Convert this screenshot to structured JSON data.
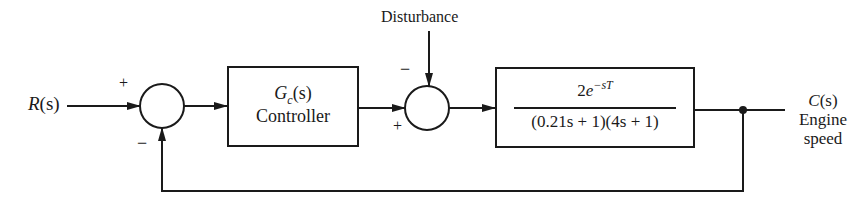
{
  "diagram": {
    "type": "feedback-control-block-diagram",
    "input": {
      "label_var": "R",
      "label_arg": "(s)"
    },
    "summing_junction_1": {
      "plus_sign": "+",
      "minus_sign": "−"
    },
    "controller": {
      "tf_main": "G",
      "tf_sub": "c",
      "tf_arg": "(s)",
      "name": "Controller"
    },
    "disturbance": {
      "label": "Disturbance"
    },
    "summing_junction_2": {
      "minus_sign": "−",
      "plus_sign": "+"
    },
    "plant": {
      "numerator_coef": "2",
      "numerator_base": "e",
      "numerator_exp": "−sT",
      "denominator": "(0.21s + 1)(4s + 1)"
    },
    "output": {
      "label_var": "C",
      "label_arg": "(s)",
      "line1": "Engine",
      "line2": "speed"
    },
    "colors": {
      "stroke": "#1a1a1a",
      "background": "#ffffff"
    }
  }
}
